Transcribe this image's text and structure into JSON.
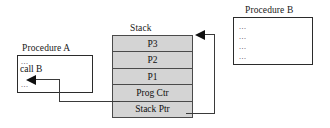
{
  "diagram": {
    "background_color": "#ffffff",
    "line_color": "#3a3a3a",
    "stack_fill_color": "#d4d4d4",
    "box_border_color": "#2b2b2b",
    "text_color": "#101010"
  },
  "procedure_a": {
    "label": "Procedure A",
    "lines": [
      {
        "text": "...",
        "kind": "ellipsis"
      },
      {
        "text": "call B",
        "kind": "code"
      },
      {
        "text": "...",
        "kind": "ellipsis"
      }
    ]
  },
  "procedure_b": {
    "label": "Procedure B",
    "lines": [
      {
        "text": "...",
        "kind": "ellipsis"
      },
      {
        "text": "...",
        "kind": "ellipsis"
      },
      {
        "text": "...",
        "kind": "ellipsis"
      },
      {
        "text": "...",
        "kind": "ellipsis"
      }
    ]
  },
  "stack": {
    "label": "Stack",
    "cells": [
      {
        "label": "P3"
      },
      {
        "label": "P2"
      },
      {
        "label": "P1"
      },
      {
        "label": "Prog Ctr"
      },
      {
        "label": "Stack Ptr"
      }
    ]
  },
  "connectors": [
    {
      "name": "prog-ctr-to-procedure-a",
      "from": "Prog Ctr",
      "to": "Procedure A return point",
      "arrowhead": "left"
    },
    {
      "name": "stack-ptr-to-stack-top",
      "from": "Stack Ptr",
      "to": "top of Stack",
      "arrowhead": "left"
    }
  ]
}
